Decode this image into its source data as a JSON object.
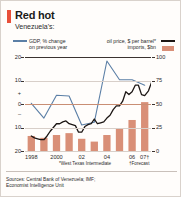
{
  "header": {
    "title": "Red hot",
    "subtitle": "Venezuela's:"
  },
  "legend": {
    "gdp_line1": "GDP, % change",
    "gdp_line2": "on previous year",
    "oil_label": "oil price, $ per barrel*",
    "imports_label": "imports, $bn",
    "gdp_color": "#5b7fa6",
    "oil_color": "#1c1614",
    "imports_color": "#d98f77"
  },
  "footnotes": {
    "wti": "*West Texas Intermediate",
    "forecast": "†Forecast"
  },
  "sources": {
    "line1": "Sources: Central Bank of Venezuela; IMF;",
    "line2": "Economist Intelligence Unit"
  },
  "chart_data": {
    "type": "line",
    "title": "Red hot",
    "subtitle": "Venezuela's:",
    "xlabel": "",
    "ylabel": "GDP, % change on previous year",
    "y2label": "oil price, $ per barrel; imports, $bn",
    "ylim": [
      -20,
      20
    ],
    "y2lim": [
      0,
      100
    ],
    "grid": true,
    "legend_position": "top",
    "left_ticks": [
      "20",
      "10",
      "+",
      "0",
      "–",
      "10",
      "20"
    ],
    "left_tick_values": [
      20,
      10,
      0,
      -10,
      -20
    ],
    "right_ticks": [
      "100",
      "75",
      "50",
      "25",
      "0"
    ],
    "right_tick_values": [
      100,
      75,
      50,
      25,
      0
    ],
    "x_tick_labels": [
      "1998",
      "2000",
      "02",
      "04",
      "06",
      "07†"
    ],
    "x_tick_years": [
      1998,
      2000,
      2002,
      2004,
      2006,
      2007
    ],
    "years": [
      1998,
      1999,
      2000,
      2001,
      2002,
      2003,
      2004,
      2005,
      2006,
      2007
    ],
    "forecast_from": 2007,
    "series": [
      {
        "name": "GDP, % change on previous year",
        "type": "line",
        "axis": "left",
        "color": "#5b7fa6",
        "x": [
          1998,
          1999,
          2000,
          2001,
          2002,
          2003,
          2004,
          2005,
          2006,
          2007
        ],
        "values": [
          0.3,
          -6.0,
          3.7,
          3.4,
          -8.9,
          -7.8,
          18.3,
          10.3,
          10.3,
          8.0
        ]
      },
      {
        "name": "oil price, $ per barrel*",
        "type": "line",
        "axis": "right",
        "color": "#1c1614",
        "x": [
          1998.0,
          1998.25,
          1998.5,
          1998.75,
          1999.0,
          1999.25,
          1999.5,
          1999.75,
          2000.0,
          2000.25,
          2000.5,
          2000.75,
          2001.0,
          2001.25,
          2001.5,
          2001.75,
          2002.0,
          2002.25,
          2002.5,
          2002.75,
          2003.0,
          2003.25,
          2003.5,
          2003.75,
          2004.0,
          2004.25,
          2004.5,
          2004.75,
          2005.0,
          2005.25,
          2005.5,
          2005.75,
          2006.0,
          2006.25,
          2006.5,
          2006.75,
          2007.0,
          2007.3,
          2007.6,
          2007.9
        ],
        "values": [
          16,
          14,
          13,
          12,
          12,
          16,
          21,
          25,
          29,
          29,
          31,
          32,
          29,
          28,
          27,
          20,
          20,
          26,
          28,
          29,
          34,
          29,
          30,
          31,
          35,
          38,
          44,
          48,
          48,
          53,
          63,
          60,
          63,
          70,
          70,
          60,
          59,
          64,
          75,
          94
        ]
      },
      {
        "name": "imports, $bn",
        "type": "bar",
        "axis": "right",
        "color": "#d98f77",
        "x": [
          1998,
          1999,
          2000,
          2001,
          2002,
          2003,
          2004,
          2005,
          2006,
          2007
        ],
        "values": [
          16,
          14,
          17,
          19,
          13,
          10,
          17,
          24,
          33,
          52
        ]
      }
    ]
  }
}
